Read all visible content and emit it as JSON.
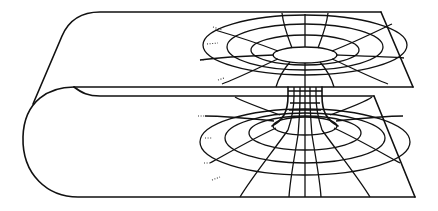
{
  "diagram": {
    "parts": [
      "upper-sheet",
      "lower-sheet",
      "throat",
      "fold"
    ],
    "colors": {
      "line": "#111111",
      "background": "#ffffff"
    }
  }
}
